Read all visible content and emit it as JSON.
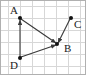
{
  "figure": {
    "width": 86,
    "height": 75,
    "background_color": "#ffffff",
    "border_color": "#b0b0b0",
    "grid_color": "#d7d7d7",
    "grid_cell_size": 12,
    "edge_color": "#3a3a3a",
    "vertex_color": "#111111",
    "label_color": "#1a1a1a"
  },
  "vertices": [
    {
      "id": "A",
      "label": "A",
      "x": 20,
      "y": 18,
      "label_x": 10,
      "label_y": 14
    },
    {
      "id": "B",
      "label": "B",
      "x": 57,
      "y": 44,
      "label_x": 64,
      "label_y": 52
    },
    {
      "id": "C",
      "label": "C",
      "x": 71,
      "y": 18,
      "label_x": 74,
      "label_y": 28
    },
    {
      "id": "D",
      "label": "D",
      "x": 20,
      "y": 58,
      "label_x": 10,
      "label_y": 69
    }
  ],
  "edges": [
    {
      "id": "D-A",
      "from": "D",
      "to": "A",
      "x1": 20,
      "y1": 58,
      "x2": 20,
      "y2": 20,
      "arrow": "end"
    },
    {
      "id": "A-B",
      "from": "A",
      "to": "B",
      "x1": 21,
      "y1": 19,
      "x2": 56,
      "y2": 43,
      "arrow": "end"
    },
    {
      "id": "D-B",
      "from": "D",
      "to": "B",
      "x1": 21,
      "y1": 57,
      "x2": 56,
      "y2": 45,
      "arrow": "end"
    },
    {
      "id": "C-B",
      "from": "C",
      "to": "B",
      "x1": 70,
      "y1": 19,
      "x2": 58,
      "y2": 43,
      "arrow": "end"
    }
  ],
  "grid": {
    "vertical_lines": [
      8,
      20,
      32,
      44,
      56,
      68,
      80
    ],
    "horizontal_lines": [
      6,
      18,
      30,
      42,
      54,
      66
    ]
  }
}
